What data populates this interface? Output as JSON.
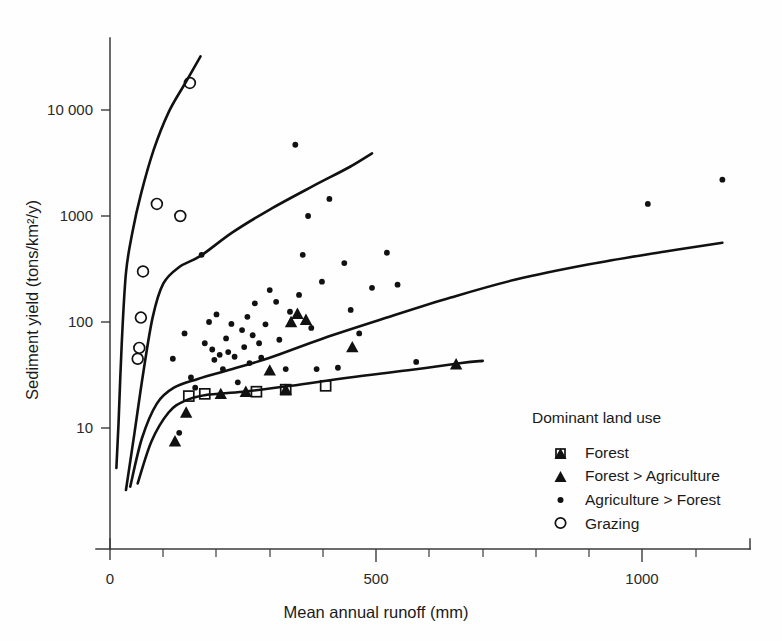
{
  "chart_data": {
    "type": "scatter",
    "title": "",
    "xlabel": "Mean annual runoff (mm)",
    "ylabel": "Sediment yield (tons/km²/y)",
    "xlim": [
      0,
      1200
    ],
    "ylim": [
      2,
      40000
    ],
    "yscale": "log",
    "xscale": "linear",
    "grid": false,
    "legend_position": "lower-right",
    "legend_title": "Dominant land use",
    "xticks_major": [
      0,
      500,
      1000
    ],
    "xticklabels": [
      "0",
      "500",
      "1000"
    ],
    "xticks_minor": [
      100,
      200,
      300,
      400,
      600,
      700,
      800,
      900,
      1100,
      1200
    ],
    "yticks": [
      10,
      100,
      1000,
      10000
    ],
    "yticklabels": [
      "10",
      "100",
      "1000",
      "10 000"
    ],
    "series": [
      {
        "name": "Forest",
        "marker": "open-square",
        "points": [
          [
            148,
            20
          ],
          [
            178,
            21
          ],
          [
            275,
            22
          ],
          [
            330,
            23
          ],
          [
            405,
            25
          ]
        ]
      },
      {
        "name": "Forest > Agriculture",
        "marker": "filled-triangle",
        "points": [
          [
            122,
            7.5
          ],
          [
            143,
            14
          ],
          [
            208,
            21
          ],
          [
            255,
            22
          ],
          [
            330,
            23
          ],
          [
            300,
            35
          ],
          [
            340,
            100
          ],
          [
            352,
            120
          ],
          [
            368,
            105
          ],
          [
            455,
            58
          ],
          [
            650,
            40
          ]
        ]
      },
      {
        "name": "Agriculture > Forest",
        "marker": "small-dot",
        "points": [
          [
            118,
            45
          ],
          [
            130,
            9
          ],
          [
            140,
            78
          ],
          [
            152,
            30
          ],
          [
            160,
            24
          ],
          [
            172,
            430
          ],
          [
            178,
            63
          ],
          [
            186,
            100
          ],
          [
            192,
            55
          ],
          [
            196,
            44
          ],
          [
            200,
            118
          ],
          [
            206,
            49
          ],
          [
            212,
            36
          ],
          [
            218,
            70
          ],
          [
            222,
            52
          ],
          [
            228,
            96
          ],
          [
            234,
            47
          ],
          [
            240,
            27
          ],
          [
            248,
            84
          ],
          [
            252,
            58
          ],
          [
            258,
            112
          ],
          [
            262,
            41
          ],
          [
            268,
            75
          ],
          [
            272,
            150
          ],
          [
            280,
            63
          ],
          [
            284,
            46
          ],
          [
            292,
            95
          ],
          [
            300,
            200
          ],
          [
            312,
            155
          ],
          [
            318,
            68
          ],
          [
            330,
            36
          ],
          [
            338,
            125
          ],
          [
            348,
            4700
          ],
          [
            355,
            180
          ],
          [
            362,
            430
          ],
          [
            372,
            1000
          ],
          [
            378,
            88
          ],
          [
            388,
            36
          ],
          [
            398,
            240
          ],
          [
            412,
            1450
          ],
          [
            428,
            37
          ],
          [
            440,
            360
          ],
          [
            452,
            130
          ],
          [
            468,
            78
          ],
          [
            492,
            210
          ],
          [
            520,
            450
          ],
          [
            540,
            225
          ],
          [
            575,
            42
          ],
          [
            1010,
            1300
          ],
          [
            1150,
            2200
          ]
        ]
      },
      {
        "name": "Grazing",
        "marker": "open-circle",
        "points": [
          [
            52,
            45
          ],
          [
            55,
            57
          ],
          [
            58,
            110
          ],
          [
            62,
            300
          ],
          [
            88,
            1300
          ],
          [
            132,
            1000
          ],
          [
            150,
            18000
          ]
        ]
      }
    ],
    "trend_curves": [
      {
        "name": "grazing-envelope",
        "path_points": [
          [
            12,
            4.2
          ],
          [
            16,
            11
          ],
          [
            22,
            62
          ],
          [
            30,
            290
          ],
          [
            42,
            700
          ],
          [
            58,
            1600
          ],
          [
            82,
            4200
          ],
          [
            110,
            9500
          ],
          [
            140,
            17500
          ],
          [
            170,
            32000
          ]
        ]
      },
      {
        "name": "agriculture-envelope",
        "path_points": [
          [
            30,
            2.6
          ],
          [
            46,
            9
          ],
          [
            62,
            32
          ],
          [
            80,
            110
          ],
          [
            100,
            230
          ],
          [
            130,
            330
          ],
          [
            170,
            420
          ],
          [
            230,
            700
          ],
          [
            300,
            1150
          ],
          [
            380,
            1900
          ],
          [
            450,
            2900
          ],
          [
            492,
            3900
          ]
        ]
      },
      {
        "name": "agriculture-lower-envelope",
        "path_points": [
          [
            38,
            2.8
          ],
          [
            60,
            8
          ],
          [
            88,
            17
          ],
          [
            120,
            24
          ],
          [
            165,
            29
          ],
          [
            230,
            36
          ],
          [
            300,
            46
          ],
          [
            400,
            70
          ],
          [
            520,
            110
          ],
          [
            640,
            170
          ],
          [
            760,
            250
          ],
          [
            900,
            350
          ],
          [
            1040,
            460
          ],
          [
            1150,
            560
          ]
        ]
      },
      {
        "name": "forest-envelope",
        "path_points": [
          [
            52,
            3.0
          ],
          [
            78,
            7.5
          ],
          [
            110,
            14
          ],
          [
            140,
            18
          ],
          [
            180,
            20.5
          ],
          [
            250,
            22
          ],
          [
            340,
            25
          ],
          [
            450,
            30
          ],
          [
            560,
            35
          ],
          [
            660,
            41
          ],
          [
            700,
            43
          ]
        ]
      }
    ]
  },
  "legend": {
    "title": "Dominant land use",
    "items": [
      {
        "label": "Forest",
        "marker": "open-square"
      },
      {
        "label": "Forest > Agriculture",
        "marker": "filled-triangle"
      },
      {
        "label": "Agriculture > Forest",
        "marker": "small-dot"
      },
      {
        "label": "Grazing",
        "marker": "open-circle"
      }
    ]
  },
  "axes": {
    "x_title": "Mean annual runoff (mm)",
    "y_title": "Sediment yield (tons/km²/y)"
  },
  "colors": {
    "ink": "#111111",
    "axis": "#3b3b3b",
    "background": "#fefefe"
  }
}
